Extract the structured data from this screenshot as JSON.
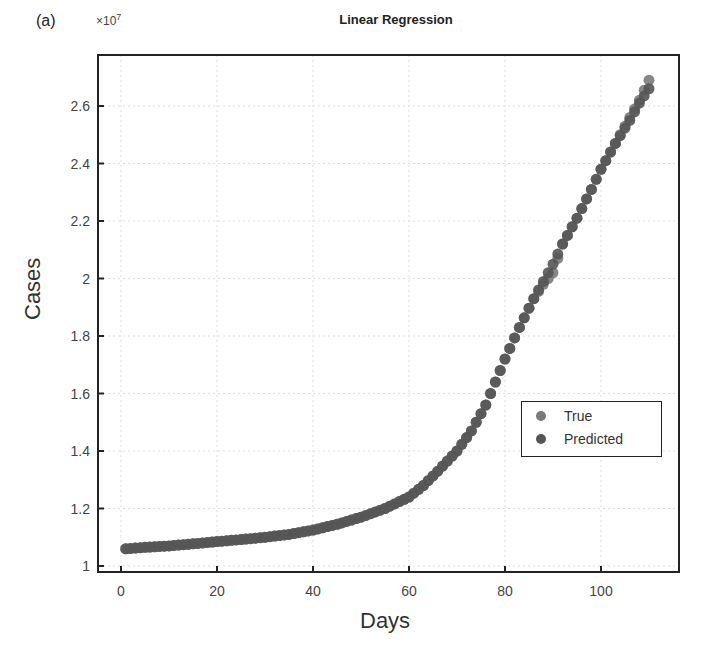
{
  "figure": {
    "panel_label": "(a)",
    "title": "Linear Regression",
    "y_exponent_base": "×10",
    "y_exponent_power": "7",
    "xlabel": "Days",
    "ylabel": "Cases"
  },
  "legend": {
    "items": [
      {
        "label": "True",
        "color": "#7a7a7a"
      },
      {
        "label": "Predicted",
        "color": "#555555"
      }
    ]
  },
  "colors": {
    "true_marker": "#7a7a7a",
    "predicted_marker": "#555555",
    "axis": "#222222",
    "grid": "#dddddd"
  },
  "chart_data": {
    "type": "scatter",
    "title": "Linear Regression",
    "xlabel": "Days",
    "ylabel": "Cases",
    "y_scale_note": "×10^7",
    "xlim": [
      -4,
      116
    ],
    "ylim": [
      0.98,
      2.78
    ],
    "xticks": [
      0,
      20,
      40,
      60,
      80,
      100
    ],
    "yticks": [
      1,
      1.2,
      1.4,
      1.6,
      1.8,
      2,
      2.2,
      2.4,
      2.6
    ],
    "ytick_labels": [
      "1",
      "1.2",
      "1.4",
      "1.6",
      "1.8",
      "2",
      "2.2",
      "2.4",
      "2.6"
    ],
    "grid": true,
    "legend_position": "lower right",
    "x": [
      1,
      5,
      10,
      15,
      20,
      25,
      30,
      35,
      40,
      45,
      50,
      55,
      60,
      63,
      66,
      70,
      73,
      76,
      80,
      83,
      86,
      88,
      90,
      92,
      95,
      98,
      100,
      103,
      106,
      108,
      110
    ],
    "series": [
      {
        "name": "True",
        "values": [
          1.06,
          1.065,
          1.07,
          1.077,
          1.085,
          1.092,
          1.1,
          1.11,
          1.125,
          1.145,
          1.17,
          1.2,
          1.24,
          1.28,
          1.33,
          1.4,
          1.47,
          1.56,
          1.72,
          1.83,
          1.93,
          1.98,
          2.02,
          2.12,
          2.21,
          2.31,
          2.38,
          2.47,
          2.56,
          2.62,
          2.69
        ]
      },
      {
        "name": "Predicted",
        "values": [
          1.06,
          1.065,
          1.07,
          1.077,
          1.085,
          1.092,
          1.1,
          1.11,
          1.125,
          1.145,
          1.17,
          1.2,
          1.24,
          1.28,
          1.33,
          1.4,
          1.47,
          1.56,
          1.72,
          1.83,
          1.93,
          1.99,
          2.05,
          2.12,
          2.21,
          2.31,
          2.38,
          2.47,
          2.55,
          2.61,
          2.66
        ]
      }
    ]
  }
}
